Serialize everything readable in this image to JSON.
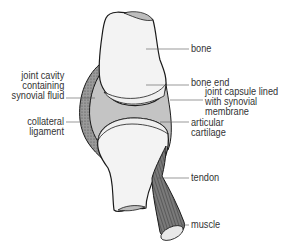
{
  "diagram": {
    "colors": {
      "outline": "#1a1a1a",
      "bone_fill": "#f7f7f7",
      "cavity_fill": "#c4c4c4",
      "cartilage_fill": "#efefef",
      "ligament_fill": "#8a8a8a",
      "tendon_fill": "#7a7a7a",
      "leader_line": "#555555",
      "label_text": "#333333"
    },
    "labels": {
      "bone": "bone",
      "bone_end": "bone end",
      "joint_capsule": [
        "joint capsule lined",
        "with synovial",
        "membrane"
      ],
      "articular_cartilage": [
        "articular",
        "cartilage"
      ],
      "tendon": "tendon",
      "muscle": "muscle",
      "joint_cavity": [
        "joint cavity",
        "containing",
        "synovial fluid"
      ],
      "collateral_ligament": [
        "collateral",
        "ligament"
      ]
    }
  }
}
